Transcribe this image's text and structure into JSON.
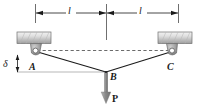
{
  "figure": {
    "type": "engineering-statics-diagram",
    "colors": {
      "line": "#1a1a1a",
      "thin_line": "#808080",
      "dashed_line": "#666666",
      "hatch_block_light": "#e8e8e8",
      "hatch_block_dark": "#9a9a9a",
      "pin_body": "#a8a8a8",
      "pin_hole": "#ffffff",
      "load_arrow": "#8c8c8c",
      "background": "#ffffff"
    },
    "labels": {
      "dim_left": "l",
      "dim_right": "l",
      "node_a": "A",
      "node_b": "B",
      "node_c": "C",
      "deflection": "δ",
      "load": "P"
    },
    "geometry": {
      "support_left_pin": {
        "x": 35,
        "y": 51
      },
      "support_right_pin": {
        "x": 172,
        "y": 51
      },
      "node_b": {
        "x": 106,
        "y": 72
      },
      "span_half_left": 71,
      "span_half_right": 66,
      "dimension_line_y": 13,
      "load_arrow_tip_y": 103
    }
  }
}
